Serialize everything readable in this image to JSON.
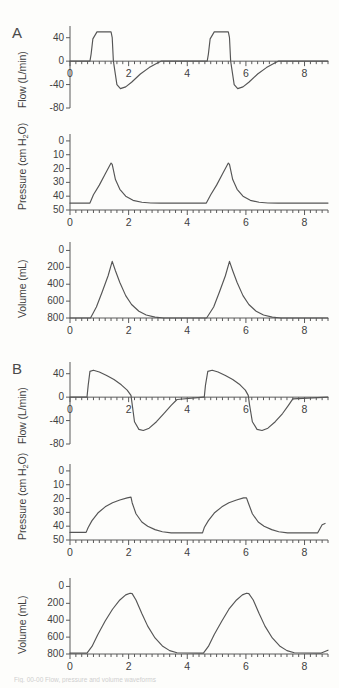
{
  "figure": {
    "panel_a_letter": "A",
    "panel_b_letter": "B",
    "caption": "Fig. 00-00  Flow, pressure and volume waveforms"
  },
  "axes": {
    "x_label_0": "0",
    "x_label_2": "2",
    "x_label_4": "4",
    "x_label_6": "6",
    "x_label_8": "8",
    "flow_ylabel": "Flow (L/min)",
    "pressure_ylabel": "Pressure (cm H",
    "pressure_ylabel_sub": "2",
    "pressure_ylabel_end": "O)",
    "volume_ylabel": "Volume (mL)",
    "flow_ticks": [
      "40",
      "0",
      "-40",
      "-80"
    ],
    "pressure_ticks": [
      "50",
      "40",
      "30",
      "20",
      "10",
      "0"
    ],
    "volume_ticks": [
      "800",
      "600",
      "400",
      "200",
      "0"
    ]
  },
  "chart_data": [
    {
      "type": "line",
      "id": "a-flow",
      "panel": "A",
      "title": "",
      "xlabel": "",
      "ylabel": "Flow (L/min)",
      "xlim": [
        0,
        8.8
      ],
      "ylim": [
        -80,
        60
      ],
      "yticks": [
        40,
        0,
        -40,
        -80
      ],
      "xticks": [
        0,
        2,
        4,
        6,
        8
      ],
      "xtick_minor_step": 0.2,
      "grid": false,
      "legend": "none",
      "waveform": "square-inspiratory-flow",
      "peak_inspiratory_flow": 50,
      "peak_expiratory_flow": -47,
      "cycle_period": 4.0,
      "x": [
        0,
        0.68,
        0.72,
        0.78,
        0.92,
        1.4,
        1.44,
        1.48,
        1.6,
        1.72,
        1.9,
        2.1,
        2.4,
        2.7,
        2.95,
        3.1,
        4.65,
        4.68,
        4.72,
        4.78,
        4.92,
        5.4,
        5.44,
        5.48,
        5.6,
        5.72,
        5.9,
        6.1,
        6.4,
        6.7,
        6.95,
        7.1,
        8.8
      ],
      "y": [
        0,
        0,
        12,
        38,
        50,
        50,
        40,
        0,
        -40,
        -47,
        -44,
        -36,
        -22,
        -11,
        -4,
        0,
        0,
        0,
        12,
        38,
        50,
        50,
        40,
        0,
        -40,
        -47,
        -44,
        -36,
        -22,
        -11,
        -4,
        0,
        0
      ]
    },
    {
      "type": "line",
      "id": "a-pressure",
      "panel": "A",
      "ylabel": "Pressure (cm H2O)",
      "xlim": [
        0,
        8.8
      ],
      "ylim": [
        0,
        55
      ],
      "yticks": [
        0,
        10,
        20,
        30,
        40,
        50
      ],
      "xticks": [
        0,
        2,
        4,
        6,
        8
      ],
      "xtick_minor_step": 0.2,
      "grid": false,
      "legend": "none",
      "waveform": "linear-rising-ramp",
      "peak_pressure": 34,
      "peep": 5,
      "cycle_period": 4.0,
      "x": [
        0,
        0.68,
        0.8,
        1.0,
        1.2,
        1.4,
        1.44,
        1.55,
        1.7,
        1.9,
        2.15,
        2.45,
        2.75,
        3.1,
        4.6,
        4.65,
        4.8,
        5.0,
        5.2,
        5.4,
        5.44,
        5.55,
        5.7,
        5.9,
        6.15,
        6.45,
        6.75,
        7.1,
        8.6,
        8.8
      ],
      "y": [
        5,
        5,
        11,
        18,
        26,
        34,
        33,
        22,
        15,
        10,
        7,
        5.6,
        5.1,
        5,
        5,
        5,
        11,
        18,
        26,
        34,
        33,
        22,
        15,
        10,
        7,
        5.6,
        5.1,
        5,
        5,
        5
      ]
    },
    {
      "type": "line",
      "id": "a-volume",
      "panel": "A",
      "ylabel": "Volume (mL)",
      "xlim": [
        0,
        8.8
      ],
      "ylim": [
        0,
        900
      ],
      "yticks": [
        0,
        200,
        400,
        600,
        800
      ],
      "xticks": [
        0,
        2,
        4,
        6,
        8
      ],
      "xtick_minor_step": 0.2,
      "grid": false,
      "legend": "none",
      "waveform": "triangular-tidal-volume",
      "tidal_volume": 670,
      "cycle_period": 4.0,
      "x": [
        0,
        0.7,
        0.9,
        1.1,
        1.3,
        1.44,
        1.55,
        1.7,
        1.9,
        2.1,
        2.35,
        2.6,
        2.9,
        3.2,
        4.6,
        4.66,
        4.9,
        5.1,
        5.3,
        5.44,
        5.55,
        5.7,
        5.9,
        6.1,
        6.35,
        6.6,
        6.9,
        7.2,
        8.8
      ],
      "y": [
        0,
        0,
        130,
        310,
        500,
        670,
        560,
        420,
        265,
        160,
        80,
        35,
        10,
        0,
        0,
        0,
        130,
        310,
        500,
        670,
        560,
        420,
        265,
        160,
        80,
        35,
        10,
        0,
        0
      ]
    },
    {
      "type": "line",
      "id": "b-flow",
      "panel": "B",
      "ylabel": "Flow (L/min)",
      "xlim": [
        0,
        8.8
      ],
      "ylim": [
        -80,
        60
      ],
      "yticks": [
        40,
        0,
        -40,
        -80
      ],
      "xticks": [
        0,
        2,
        4,
        6,
        8
      ],
      "xtick_minor_step": 0.2,
      "grid": false,
      "legend": "none",
      "waveform": "decelerating-inspiratory-flow",
      "peak_inspiratory_flow": 46,
      "peak_expiratory_flow": -57,
      "cycle_period": 4.0,
      "x": [
        0,
        0.58,
        0.62,
        0.68,
        0.8,
        1.0,
        1.25,
        1.5,
        1.75,
        1.95,
        2.08,
        2.12,
        2.2,
        2.35,
        2.5,
        2.7,
        2.95,
        3.2,
        3.45,
        3.65,
        4.55,
        4.58,
        4.62,
        4.7,
        4.85,
        5.05,
        5.3,
        5.55,
        5.8,
        5.98,
        6.08,
        6.12,
        6.22,
        6.38,
        6.55,
        6.75,
        7.0,
        7.25,
        7.45,
        7.6,
        8.8
      ],
      "y": [
        0,
        0,
        20,
        44,
        46,
        43,
        37,
        30,
        21,
        12,
        3,
        -12,
        -42,
        -55,
        -57,
        -53,
        -42,
        -28,
        -14,
        -4,
        0,
        0,
        20,
        44,
        46,
        43,
        37,
        30,
        21,
        12,
        3,
        -12,
        -42,
        -55,
        -57,
        -53,
        -42,
        -28,
        -14,
        -3,
        0
      ]
    },
    {
      "type": "line",
      "id": "b-pressure",
      "panel": "B",
      "ylabel": "Pressure (cm H2O)",
      "xlim": [
        0,
        8.8
      ],
      "ylim": [
        0,
        55
      ],
      "yticks": [
        0,
        10,
        20,
        30,
        40,
        50
      ],
      "xticks": [
        0,
        2,
        4,
        6,
        8
      ],
      "xtick_minor_step": 0.2,
      "grid": false,
      "legend": "none",
      "waveform": "exponential-rising-pressure",
      "peak_pressure": 31,
      "peep": 5,
      "cycle_period": 4.0,
      "x": [
        0,
        0.55,
        0.62,
        0.75,
        0.95,
        1.2,
        1.45,
        1.7,
        1.95,
        2.08,
        2.12,
        2.25,
        2.45,
        2.65,
        2.9,
        3.15,
        3.45,
        4.45,
        4.52,
        4.58,
        4.72,
        4.92,
        5.18,
        5.42,
        5.68,
        5.92,
        6.02,
        6.08,
        6.22,
        6.42,
        6.62,
        6.88,
        7.12,
        7.42,
        8.45,
        8.52,
        8.6,
        8.7
      ],
      "y": [
        5.5,
        5.5,
        9,
        14,
        19.5,
        24,
        27,
        29,
        30.5,
        31,
        27,
        19,
        13,
        10,
        7.5,
        6,
        5.2,
        5.2,
        5.2,
        9,
        14,
        19.5,
        24,
        27,
        29,
        30.5,
        30.5,
        27,
        19,
        13,
        10,
        7.5,
        6,
        5.2,
        5.2,
        8,
        11,
        12
      ]
    },
    {
      "type": "line",
      "id": "b-volume",
      "panel": "B",
      "ylabel": "Volume (mL)",
      "xlim": [
        0,
        8.8
      ],
      "ylim": [
        0,
        900
      ],
      "yticks": [
        0,
        200,
        400,
        600,
        800
      ],
      "xticks": [
        0,
        2,
        4,
        6,
        8
      ],
      "xtick_minor_step": 0.2,
      "grid": false,
      "legend": "none",
      "waveform": "rounded-tidal-volume",
      "tidal_volume": 720,
      "cycle_period": 4.0,
      "x": [
        0,
        0.58,
        0.75,
        0.95,
        1.2,
        1.45,
        1.7,
        1.9,
        2.05,
        2.12,
        2.25,
        2.45,
        2.65,
        2.9,
        3.15,
        3.4,
        3.65,
        4.45,
        4.55,
        4.72,
        4.92,
        5.18,
        5.42,
        5.68,
        5.88,
        6.02,
        6.1,
        6.25,
        6.45,
        6.65,
        6.9,
        7.15,
        7.4,
        7.65,
        8.55,
        8.8
      ],
      "y": [
        10,
        10,
        90,
        230,
        390,
        530,
        640,
        700,
        720,
        715,
        640,
        480,
        330,
        190,
        95,
        40,
        15,
        10,
        10,
        90,
        230,
        390,
        530,
        640,
        700,
        720,
        715,
        640,
        480,
        330,
        190,
        95,
        40,
        15,
        10,
        45
      ]
    }
  ]
}
